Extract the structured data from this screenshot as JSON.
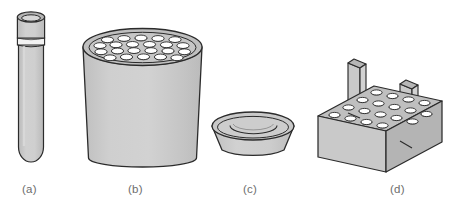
{
  "figure": {
    "background_color": "#ffffff",
    "width": 465,
    "height": 214,
    "style": "line drawing with flat gray shading, isometric / three-quarter view",
    "palette": {
      "outline": "#2b2b2b",
      "body_fill": "#c9c9c9",
      "body_fill_light": "#d4d4d4",
      "top_face_fill": "#bdbdbd",
      "side_face_dark": "#b3b3b3",
      "hole_fill": "#ffffff",
      "label_color": "#6d6d6d",
      "background": "#ffffff"
    },
    "items": [
      {
        "key": "a",
        "label": "(a)",
        "name": "test-tube",
        "description": "Round-bottom test tube with flared rim and raised ring band near the top",
        "features": [
          "flared lip",
          "ring band",
          "rounded bottom"
        ],
        "label_x": 22,
        "label_y": 183
      },
      {
        "key": "b",
        "label": "(b)",
        "name": "cylindrical-tube-block",
        "description": "Tapered cylindrical block with an array of circular tube wells in the top face",
        "hole_rows": 4,
        "hole_count": 22,
        "label_x": 128,
        "label_y": 183
      },
      {
        "key": "c",
        "label": "(c)",
        "name": "shallow-bowl",
        "description": "Shallow round dish / bowl with concentric rim rings and tapered sides",
        "rim_rings": 2,
        "label_x": 243,
        "label_y": 183
      },
      {
        "key": "d",
        "label": "(d)",
        "name": "tube-rack-with-handles",
        "description": "Rectangular tube rack in isometric view with an array of wells in the top face and two upright handle plates",
        "hole_rows": 4,
        "hole_count": 22,
        "handles": 2,
        "label_x": 390,
        "label_y": 183
      }
    ],
    "labels": {
      "a": "(a)",
      "b": "(b)",
      "c": "(c)",
      "d": "(d)"
    }
  }
}
